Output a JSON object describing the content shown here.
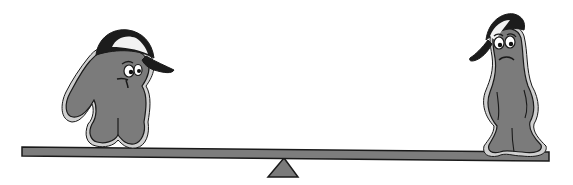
{
  "scene": {
    "description": "Seesaw illustration with two sad gray blob characters wearing baseball caps",
    "width": 573,
    "height": 185
  },
  "colors": {
    "background": "#ffffff",
    "body_fill": "#7b7b7b",
    "body_halo": "#cfcfcf",
    "outline": "#1a1a1a",
    "cap_dark": "#1c1c1c",
    "cap_light": "#f2f2f2",
    "plank_fill": "#7d7d7d",
    "fulcrum_fill": "#7a7a7a"
  },
  "seesaw": {
    "plank": {
      "left_x": 22,
      "left_top_y": 147,
      "right_x": 549,
      "right_top_y": 152,
      "thickness": 9
    },
    "fulcrum": {
      "apex_x": 284,
      "apex_y": 158,
      "base_left_x": 268,
      "base_right_x": 298,
      "base_y": 177
    }
  },
  "characters": [
    {
      "id": "left",
      "expression": "worried, looking right",
      "cap": "baseball cap, brim pointing right"
    },
    {
      "id": "right",
      "expression": "sad frown",
      "cap": "baseball cap, brim pointing left"
    }
  ]
}
